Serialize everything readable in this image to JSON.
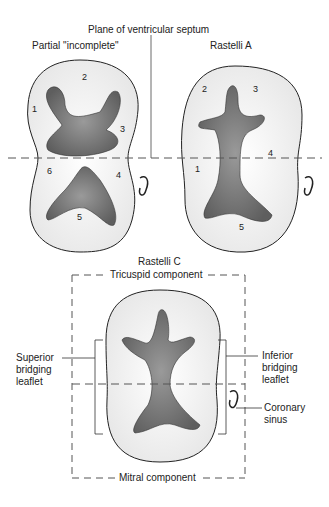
{
  "title_plane": "Plane of ventricular septum",
  "panels": {
    "partial": {
      "title": "Partial \"incomplete\"",
      "numbers": [
        "1",
        "2",
        "3",
        "4",
        "5",
        "6"
      ]
    },
    "rastelli_a": {
      "title": "Rastelli A",
      "numbers": [
        "1",
        "2",
        "3",
        "4",
        "5"
      ]
    },
    "rastelli_c": {
      "title": "Rastelli C",
      "top_label": "Tricuspid component",
      "bottom_label": "Mitral component",
      "left_label": [
        "Superior",
        "bridging",
        "leaflet"
      ],
      "right_label": [
        "Inferior",
        "bridging",
        "leaflet"
      ],
      "sinus_label": [
        "Coronary",
        "sinus"
      ]
    }
  },
  "colors": {
    "outline": "#222222",
    "valve_fill": "#f2f2f2",
    "orifice_fill": "#8a8a8a",
    "dash": "#555555"
  }
}
